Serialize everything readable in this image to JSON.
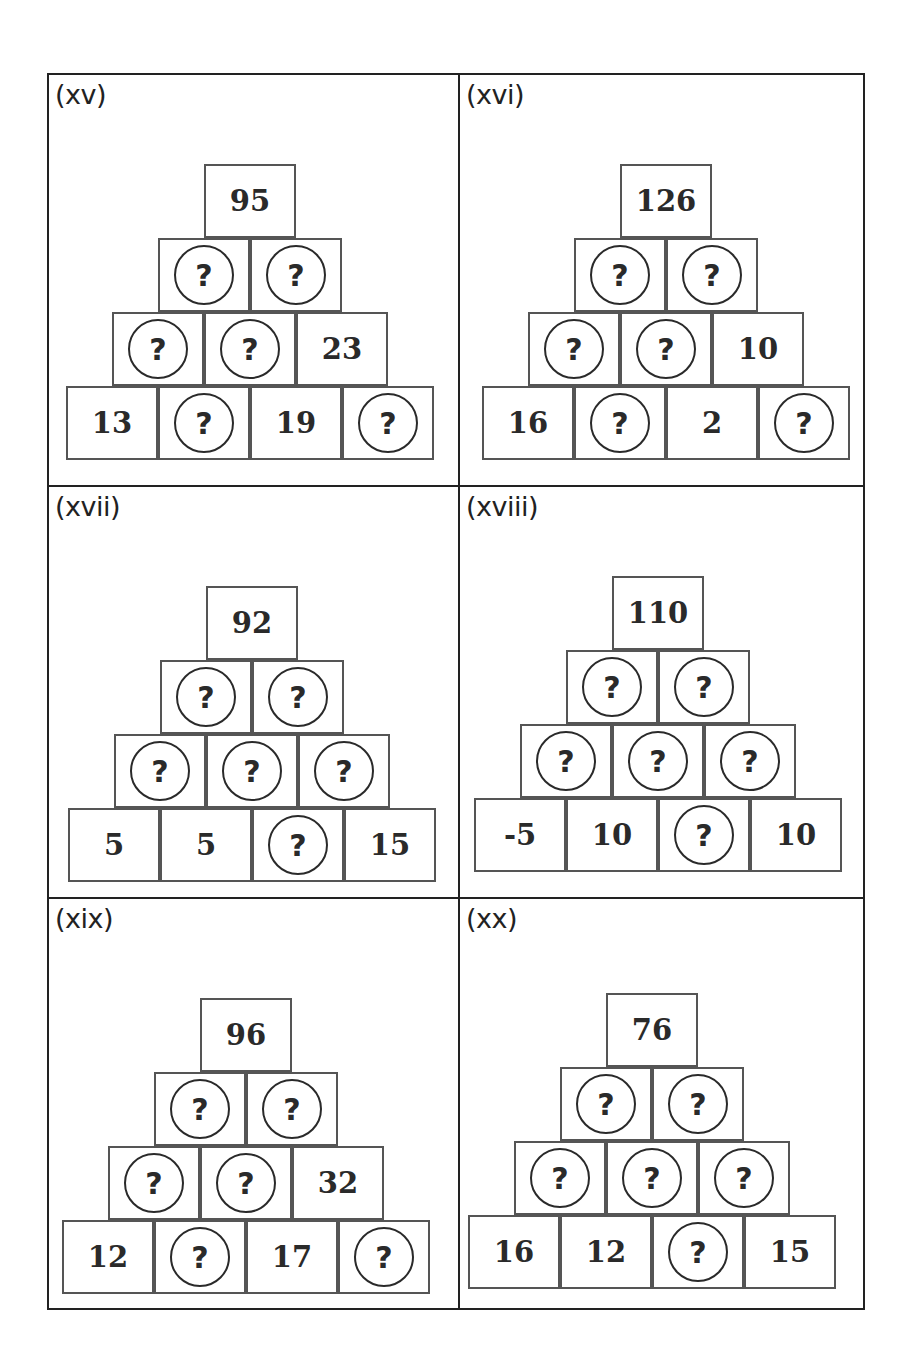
{
  "panels": [
    {
      "label": "(xv)",
      "rows": [
        [
          "95"
        ],
        [
          "?",
          "?"
        ],
        [
          "?",
          "?",
          "23"
        ],
        [
          "13",
          "?",
          "19",
          "?"
        ]
      ]
    },
    {
      "label": "(xvi)",
      "rows": [
        [
          "126"
        ],
        [
          "?",
          "?"
        ],
        [
          "?",
          "?",
          "10"
        ],
        [
          "16",
          "?",
          "2",
          "?"
        ]
      ]
    },
    {
      "label": "(xvii)",
      "rows": [
        [
          "92"
        ],
        [
          "?",
          "?"
        ],
        [
          "?",
          "?",
          "?"
        ],
        [
          "5",
          "5",
          "?",
          "15"
        ]
      ]
    },
    {
      "label": "(xviii)",
      "rows": [
        [
          "110"
        ],
        [
          "?",
          "?"
        ],
        [
          "?",
          "?",
          "?"
        ],
        [
          "-5",
          "10",
          "?",
          "10"
        ]
      ]
    },
    {
      "label": "(xix)",
      "rows": [
        [
          "96"
        ],
        [
          "?",
          "?"
        ],
        [
          "?",
          "?",
          "32"
        ],
        [
          "12",
          "?",
          "17",
          "?"
        ]
      ]
    },
    {
      "label": "(xx)",
      "rows": [
        [
          "76"
        ],
        [
          "?",
          "?"
        ],
        [
          "?",
          "?",
          "?"
        ],
        [
          "16",
          "12",
          "?",
          "15"
        ]
      ]
    }
  ],
  "unknown_symbol": "?"
}
